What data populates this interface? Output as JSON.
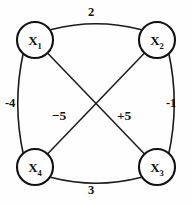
{
  "figure": {
    "type": "undirected-weighted-graph",
    "background_color": "#fefefe",
    "stroke_color": "#111111"
  },
  "nodes": [
    {
      "id": "x1",
      "base": "X",
      "sub": "1",
      "cx": 35,
      "cy": 40,
      "r": 18
    },
    {
      "id": "x2",
      "base": "X",
      "sub": "2",
      "cx": 157,
      "cy": 40,
      "r": 18
    },
    {
      "id": "x3",
      "base": "X",
      "sub": "3",
      "cx": 157,
      "cy": 167,
      "r": 18
    },
    {
      "id": "x4",
      "base": "X",
      "sub": "4",
      "cx": 35,
      "cy": 167,
      "r": 18
    }
  ],
  "edges": [
    {
      "id": "e-top",
      "from": "x1",
      "to": "x2",
      "weight": "2",
      "style": "curved-outward",
      "side": "top"
    },
    {
      "id": "e-right",
      "from": "x2",
      "to": "x3",
      "weight": "-1",
      "style": "curved-outward",
      "side": "right"
    },
    {
      "id": "e-bottom",
      "from": "x4",
      "to": "x3",
      "weight": "3",
      "style": "curved-outward",
      "side": "bottom"
    },
    {
      "id": "e-left",
      "from": "x1",
      "to": "x4",
      "weight": "-4",
      "style": "curved-outward",
      "side": "left"
    },
    {
      "id": "e-diag-x1-x3",
      "from": "x1",
      "to": "x3",
      "weight": "+5",
      "style": "straight",
      "side": "diagonal-right"
    },
    {
      "id": "e-diag-x2-x4",
      "from": "x2",
      "to": "x4",
      "weight": "−5",
      "style": "straight",
      "side": "diagonal-left"
    }
  ],
  "labels": {
    "top": "2",
    "left": "-4",
    "right": "-1",
    "diag_left": "−5",
    "diag_right": "+5",
    "bottom": "3"
  }
}
